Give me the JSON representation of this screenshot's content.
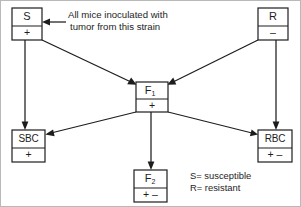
{
  "figure": {
    "ink_color": "#1d1d1d",
    "background_color": "#ffffff",
    "frame_color": "#b9b9b9"
  },
  "nodes": {
    "s_strain": {
      "label": "S",
      "sign": "+",
      "box": {
        "x": 12,
        "y": 8,
        "w": 30,
        "h": 32
      },
      "divider_y": 26
    },
    "r_strain": {
      "label": "R",
      "sign": "–",
      "box": {
        "x": 258,
        "y": 8,
        "w": 30,
        "h": 32
      },
      "divider_y": 26
    },
    "f1": {
      "label": "F",
      "subscript": "1",
      "sign": "+",
      "box": {
        "x": 136,
        "y": 82,
        "w": 32,
        "h": 30
      },
      "divider_y": 99
    },
    "sbc": {
      "label": "SBC",
      "sign": "+",
      "box": {
        "x": 12,
        "y": 130,
        "w": 33,
        "h": 32
      },
      "divider_y": 148
    },
    "rbc": {
      "label": "RBC",
      "sign": "+  –",
      "box": {
        "x": 258,
        "y": 130,
        "w": 34,
        "h": 32
      },
      "divider_y": 148
    },
    "f2": {
      "label": "F",
      "subscript": "2",
      "sign": "+  –",
      "box": {
        "x": 134,
        "y": 170,
        "w": 33,
        "h": 32
      },
      "divider_y": 188
    }
  },
  "annotations": {
    "inoculation_note_line1": "All mice inoculated with",
    "inoculation_note_line2": "tumor from this strain",
    "legend_line1": "S= susceptible",
    "legend_line2": "R= resistant"
  },
  "edges": [
    {
      "name": "s-to-f1",
      "from": "s_strain",
      "to": "f1"
    },
    {
      "name": "r-to-f1",
      "from": "r_strain",
      "to": "f1"
    },
    {
      "name": "s-to-sbc",
      "from": "s_strain",
      "to": "sbc"
    },
    {
      "name": "r-to-rbc",
      "from": "r_strain",
      "to": "rbc"
    },
    {
      "name": "f1-to-sbc",
      "from": "f1",
      "to": "sbc"
    },
    {
      "name": "f1-to-rbc",
      "from": "f1",
      "to": "rbc"
    },
    {
      "name": "f1-to-f2",
      "from": "f1",
      "to": "f2"
    },
    {
      "name": "note-to-s",
      "from": "inoculation_note",
      "to": "s_strain"
    }
  ]
}
